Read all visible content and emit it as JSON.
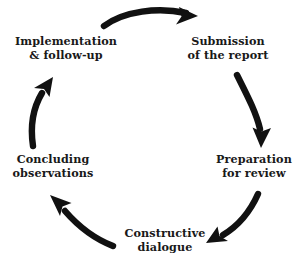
{
  "diagram": {
    "background_color": "#ffffff",
    "arrow_color": "#111111",
    "text_color": "#191919",
    "nodes": [
      {
        "id": "submission",
        "label": "Submission\nof the report",
        "position": "top-right",
        "order": 1
      },
      {
        "id": "preparation",
        "label": "Preparation\nfor review",
        "position": "right",
        "order": 2
      },
      {
        "id": "constructive",
        "label": "Constructive\ndialogue",
        "position": "bottom",
        "order": 3
      },
      {
        "id": "concluding",
        "label": "Concluding\nobservations",
        "position": "left",
        "order": 4
      },
      {
        "id": "implementation",
        "label": "Implementation\n& follow-up",
        "position": "top-left",
        "order": 5
      }
    ],
    "arrows": [
      {
        "id": "arrow-top",
        "from": "implementation",
        "to": "submission",
        "direction": "right",
        "icon": "curved-arrow-icon"
      },
      {
        "id": "arrow-right-upper",
        "from": "submission",
        "to": "preparation",
        "direction": "down",
        "icon": "curved-arrow-icon"
      },
      {
        "id": "arrow-right-lower",
        "from": "preparation",
        "to": "constructive",
        "direction": "down-left",
        "icon": "curved-arrow-icon"
      },
      {
        "id": "arrow-bottom-left",
        "from": "constructive",
        "to": "concluding",
        "direction": "up-left",
        "icon": "curved-arrow-icon"
      },
      {
        "id": "arrow-left",
        "from": "concluding",
        "to": "implementation",
        "direction": "up",
        "icon": "curved-arrow-icon"
      }
    ]
  }
}
